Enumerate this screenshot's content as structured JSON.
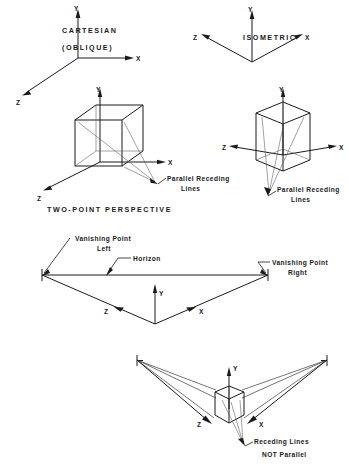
{
  "figure": {
    "background_color": "#ffffff",
    "line_color": "#1a1a1a",
    "title_note": "Comparison of axonometric projections and two-point perspective"
  },
  "sections": {
    "cartesian": {
      "heading_line1": "CARTESIAN",
      "heading_line2": "(OBLIQUE)",
      "axes": {
        "y": "Y",
        "x": "X",
        "z": "Z"
      },
      "cube_axes": {
        "y": "Y",
        "x": "X",
        "z": "Z"
      },
      "callout_line1": "Parallel Receding",
      "callout_line2": "Lines"
    },
    "isometric": {
      "heading": "ISOMETRIC",
      "axes": {
        "y": "Y",
        "x": "X",
        "z": "Z"
      },
      "cube_axes": {
        "y": "Y",
        "x": "X",
        "z": "Z"
      },
      "callout_line1": "Parallel Receding",
      "callout_line2": "Lines"
    },
    "two_point": {
      "heading": "TWO-POINT PERSPECTIVE",
      "vanishing_point_left_line1": "Vanishing Point",
      "vanishing_point_left_line2": "Left",
      "horizon_label": "Horizon",
      "vanishing_point_right_line1": "Vanishing Point",
      "vanishing_point_right_line2": "Right",
      "axes": {
        "y": "Y",
        "x": "X",
        "z": "Z"
      }
    },
    "perspective_cube": {
      "axes": {
        "y": "Y",
        "x": "X",
        "z": "Z"
      },
      "callout_line1": "Receding Lines",
      "callout_line2": "NOT Parallel"
    }
  }
}
